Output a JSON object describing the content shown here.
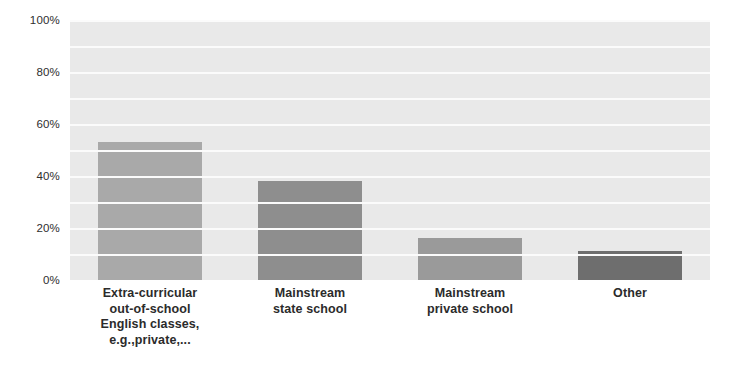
{
  "chart_data": {
    "type": "bar",
    "title": "",
    "subtitle": "",
    "xlabel": "",
    "ylabel": "",
    "ylim": [
      0,
      100
    ],
    "y_tick_labels": [
      "0%",
      "20%",
      "40%",
      "60%",
      "80%",
      "100%"
    ],
    "y_tick_values": [
      0,
      20,
      40,
      60,
      80,
      100
    ],
    "grid": "horizontal-every-10-percent",
    "grid_values": [
      10,
      20,
      30,
      40,
      50,
      60,
      70,
      80,
      90,
      100
    ],
    "legend": "none",
    "legend_position": "none",
    "plot_background": "#e9e9e9",
    "gridline_color": "#fbfbfb",
    "categories": [
      "Extra-curricular out-of-school English classes, e.g.,private,...",
      "Mainstream state school",
      "Mainstream private school",
      "Other"
    ],
    "category_label_lines": [
      [
        "Extra-curricular",
        "out-of-school",
        "English classes,",
        "e.g.,private,..."
      ],
      [
        "Mainstream",
        "state school"
      ],
      [
        "Mainstream",
        "private school"
      ],
      [
        "Other"
      ]
    ],
    "values": [
      53,
      38,
      16,
      11
    ],
    "bar_colors": [
      "#a9a9a9",
      "#8e8e8e",
      "#9a9a9a",
      "#6e6e6e"
    ]
  }
}
